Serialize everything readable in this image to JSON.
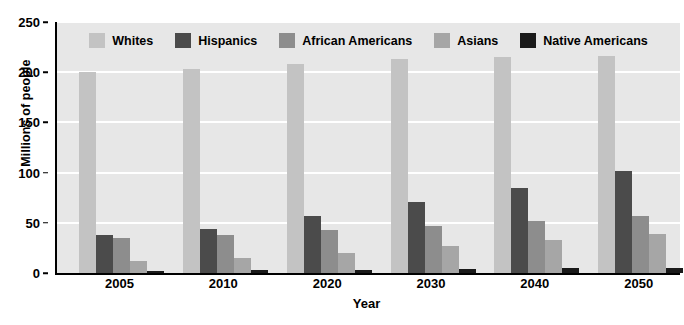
{
  "chart_data": {
    "type": "bar",
    "title": "",
    "xlabel": "Year",
    "ylabel": "Millions of people",
    "categories": [
      "2005",
      "2010",
      "2020",
      "2030",
      "2040",
      "2050"
    ],
    "ylim": [
      0,
      250
    ],
    "yticks": [
      0,
      50,
      100,
      150,
      200,
      250
    ],
    "grid": true,
    "legend_position": "top-center-inside",
    "series": [
      {
        "name": "Whites",
        "color": "#c3c3c3",
        "values": [
          200,
          203,
          208,
          213,
          215,
          216
        ]
      },
      {
        "name": "Hispanics",
        "color": "#4b4b4b",
        "values": [
          38,
          44,
          57,
          71,
          85,
          102
        ]
      },
      {
        "name": "African Americans",
        "color": "#8d8d8d",
        "values": [
          35,
          38,
          43,
          47,
          52,
          57
        ]
      },
      {
        "name": "Asians",
        "color": "#a6a6a6",
        "values": [
          12,
          15,
          20,
          27,
          33,
          39
        ]
      },
      {
        "name": "Native Americans",
        "color": "#1a1a1a",
        "values": [
          2,
          3,
          3,
          4,
          5,
          5
        ]
      }
    ]
  },
  "style": {
    "plot_background": "#e7e7e7",
    "gridline_color": "#ffffff",
    "axis_color": "#000000",
    "page_background": "#ffffff"
  }
}
